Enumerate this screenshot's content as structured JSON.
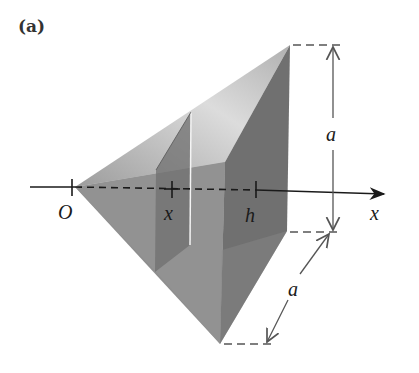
{
  "figure": {
    "panel_label": "(a)",
    "labels": {
      "origin": "O",
      "cross_section_position": "x",
      "height": "h",
      "axis": "x",
      "side_vertical": "a",
      "side_diagonal": "a"
    },
    "colors": {
      "top_face_light": "#d9d9d9",
      "top_face_mid": "#a8a8a8",
      "side_face": "#8c8c8c",
      "lower_face": "#9a9a9a",
      "base_face": "#6e6e6e",
      "cross_section": "#7a7a7a",
      "axis": "#1a1a1a",
      "dimension": "#555555"
    }
  }
}
